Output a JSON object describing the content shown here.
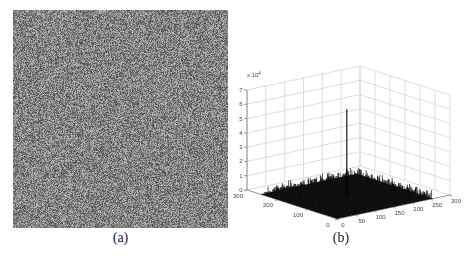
{
  "figure": {
    "background": "#ffffff",
    "caption_a": "(a)",
    "caption_b": "(b)"
  },
  "noise_image": {
    "description": "uniform random grayscale noise square",
    "width_px": 215,
    "height_px": 218,
    "mean_gray": 132,
    "amplitude": 56
  },
  "chart_data": {
    "type": "surface",
    "title": "",
    "xlabel": "",
    "ylabel": "",
    "zlabel": "",
    "x_ticks": [
      0,
      50,
      100,
      150,
      200,
      250,
      300
    ],
    "y_ticks": [
      0,
      100,
      200,
      300
    ],
    "z_ticks": [
      0,
      1,
      2,
      3,
      4,
      5,
      6,
      7
    ],
    "z_multiplier": {
      "base": "x 10",
      "exponent": "4"
    },
    "xlim": [
      0,
      300
    ],
    "ylim": [
      0,
      300
    ],
    "zlim_display": [
      0,
      7
    ],
    "grid": true,
    "legend": false,
    "surface": {
      "description": "FFT-magnitude-style mesh of the noise image: low random floor with one sharp central peak",
      "domain_x": [
        1,
        256
      ],
      "domain_y": [
        1,
        256
      ],
      "peak": {
        "x": 128,
        "y": 128,
        "z_display": 6.1
      },
      "noise_floor_max_display": 0.55
    },
    "colors": {
      "mesh": "#141414",
      "spike": "#111111",
      "grid": "#cfcfcf",
      "axis": "#7a7a7a",
      "tick_text": "#444444"
    }
  }
}
